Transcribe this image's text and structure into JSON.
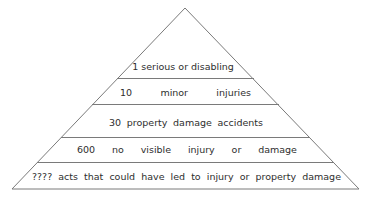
{
  "diagram": {
    "type": "pyramid",
    "title": "",
    "line_color": "#7a7a7a",
    "text_color": "#2e2e2e",
    "background": "#ffffff",
    "geometry": {
      "apex": [
        185,
        8
      ],
      "base_left": [
        12,
        189
      ],
      "base_right": [
        359,
        189
      ],
      "separators_y": [
        78,
        104,
        137,
        162
      ]
    },
    "tiers": [
      {
        "level": 1,
        "count": "1",
        "label": "1 serious or disabling",
        "words": [
          "1 serious or disabling"
        ]
      },
      {
        "level": 2,
        "count": "10",
        "label": "10 minor injuries",
        "words": [
          "10",
          "minor",
          "injuries"
        ]
      },
      {
        "level": 3,
        "count": "30",
        "label": "30 property damage accidents",
        "words": [
          "30",
          "property",
          "damage",
          "accidents"
        ]
      },
      {
        "level": 4,
        "count": "600",
        "label": "600 no visible injury or damage",
        "words": [
          "600",
          "no",
          "visible",
          "injury",
          "or",
          "damage"
        ]
      },
      {
        "level": 5,
        "count": "????",
        "label": "???? acts that could have led to injury or property damage",
        "words": [
          "????",
          "acts",
          "that",
          "could",
          "have",
          "led",
          "to",
          "injury",
          "or",
          "property",
          "damage"
        ]
      }
    ]
  }
}
